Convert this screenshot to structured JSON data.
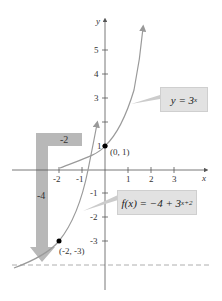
{
  "graph": {
    "x_axis_label": "x",
    "y_axis_label": "y",
    "x_ticks": [
      "-2",
      "-1",
      "1",
      "2",
      "3"
    ],
    "y_ticks": [
      "5",
      "4",
      "3",
      "2",
      "1",
      "-1",
      "-2",
      "-3"
    ],
    "points": [
      {
        "label": "(0, 1)",
        "x": 0,
        "y": 1
      },
      {
        "label": "(-2, -3)",
        "x": -2,
        "y": -3
      }
    ],
    "shift_labels": {
      "horizontal": "-2",
      "vertical": "-4"
    },
    "asymptote": {
      "y": -4,
      "style": "dashed"
    },
    "callouts": {
      "base": {
        "prefix": "y = 3",
        "exponent": "x"
      },
      "transformed": {
        "prefix": "f(x) = −4 + 3",
        "exponent": "x+2"
      }
    },
    "colors": {
      "curve": "#9a9a9a",
      "shift_arrow": "#b8b8b8",
      "callout_bg": "#e2e2e2",
      "axis": "#555555"
    }
  }
}
